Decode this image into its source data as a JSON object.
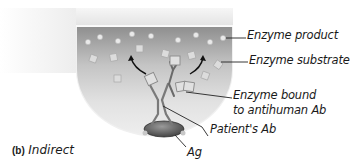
{
  "figure": {
    "panel_letter": "(b)",
    "panel_title": "Indirect",
    "labels": {
      "enzyme_product": "Enzyme product",
      "enzyme_substrate": "Enzyme substrate",
      "enzyme_bound_line1": "Enzyme bound",
      "enzyme_bound_line2": "to antihuman Ab",
      "patients_ab": "Patient's Ab",
      "ag": "Ag"
    },
    "colors": {
      "well_dark": "#9a9a9a",
      "well_light": "#e6e6e6",
      "antigen": "#555555",
      "background": "#ffffff"
    }
  }
}
